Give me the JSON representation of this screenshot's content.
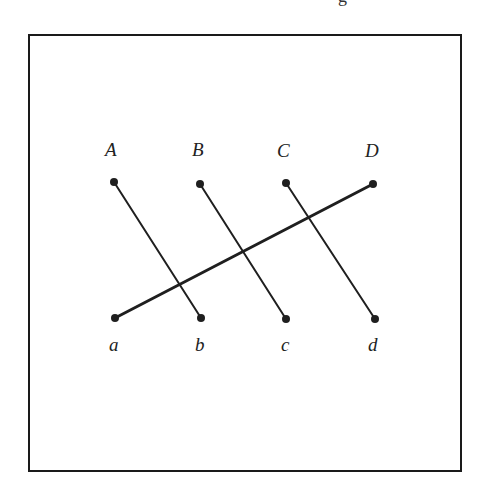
{
  "header_fragment": "g",
  "diagram": {
    "stroke_color": "#1f1f1f",
    "top_labels": [
      {
        "id": "A",
        "text": "A",
        "x": 111,
        "y": 156
      },
      {
        "id": "B",
        "text": "B",
        "x": 199,
        "y": 156
      },
      {
        "id": "C",
        "text": "C",
        "x": 284,
        "y": 157
      },
      {
        "id": "D",
        "text": "D",
        "x": 372,
        "y": 157
      }
    ],
    "bottom_labels": [
      {
        "id": "a",
        "text": "a",
        "x": 114,
        "y": 351
      },
      {
        "id": "b",
        "text": "b",
        "x": 200,
        "y": 351
      },
      {
        "id": "c",
        "text": "c",
        "x": 285,
        "y": 351
      },
      {
        "id": "d",
        "text": "d",
        "x": 374,
        "y": 351
      }
    ],
    "points": {
      "A": [
        114,
        182
      ],
      "B": [
        200,
        184
      ],
      "C": [
        286,
        183
      ],
      "D": [
        373,
        184
      ],
      "a": [
        115,
        318
      ],
      "b": [
        201,
        318
      ],
      "c": [
        286,
        319
      ],
      "d": [
        375,
        319
      ]
    },
    "segments": [
      {
        "from": "A",
        "to": "b",
        "width": 2
      },
      {
        "from": "B",
        "to": "c",
        "width": 2
      },
      {
        "from": "C",
        "to": "d",
        "width": 2
      },
      {
        "from": "a",
        "to": "D",
        "width": 3
      }
    ]
  }
}
